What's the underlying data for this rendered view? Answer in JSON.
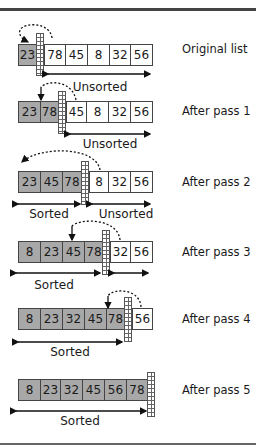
{
  "segment_labels": {
    "sorted": "Sorted",
    "unsorted": "Unsorted"
  },
  "colors": {
    "sorted_fill": "#a8a8a8",
    "unsorted_fill": "#ffffff",
    "border": "#444444"
  },
  "rows": [
    {
      "label": "Original list",
      "values": [
        "23",
        "78",
        "45",
        "8",
        "32",
        "56"
      ],
      "sorted_count": 1
    },
    {
      "label": "After pass 1",
      "values": [
        "23",
        "78",
        "45",
        "8",
        "32",
        "56"
      ],
      "sorted_count": 2
    },
    {
      "label": "After pass 2",
      "values": [
        "23",
        "45",
        "78",
        "8",
        "32",
        "56"
      ],
      "sorted_count": 3
    },
    {
      "label": "After pass 3",
      "values": [
        "8",
        "23",
        "45",
        "78",
        "32",
        "56"
      ],
      "sorted_count": 4
    },
    {
      "label": "After pass 4",
      "values": [
        "8",
        "23",
        "32",
        "45",
        "78",
        "56"
      ],
      "sorted_count": 5
    },
    {
      "label": "After pass 5",
      "values": [
        "8",
        "23",
        "32",
        "45",
        "56",
        "78"
      ],
      "sorted_count": 6
    }
  ]
}
